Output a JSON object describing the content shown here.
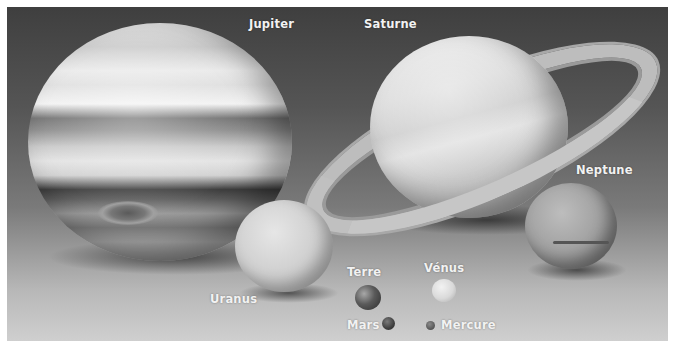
{
  "image": {
    "description": "Grayscale illustration comparing sizes of Solar System planets",
    "background_colors": [
      "#3f3f3f",
      "#7a7a7a",
      "#cfcfcf"
    ],
    "border_color": "#ffffff"
  },
  "planets": [
    {
      "id": "jupiter",
      "label": "Jupiter"
    },
    {
      "id": "saturn",
      "label": "Saturne"
    },
    {
      "id": "neptune",
      "label": "Neptune"
    },
    {
      "id": "uranus",
      "label": "Uranus"
    },
    {
      "id": "earth",
      "label": "Terre"
    },
    {
      "id": "venus",
      "label": "Vénus"
    },
    {
      "id": "mars",
      "label": "Mars"
    },
    {
      "id": "mercury",
      "label": "Mercure"
    }
  ]
}
